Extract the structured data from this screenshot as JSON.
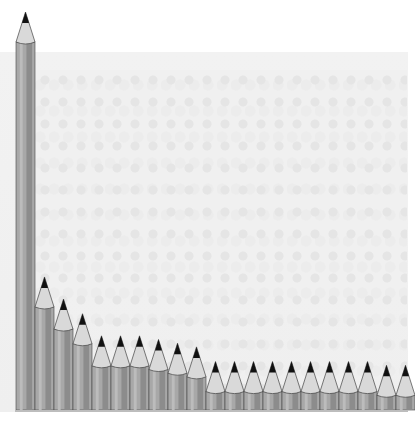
{
  "chart_data": {
    "type": "bar",
    "title": "",
    "xlabel": "",
    "ylabel": "",
    "style": "pencil-bars over grayscale crowd photo",
    "categories": [
      "1",
      "2",
      "3",
      "4",
      "5",
      "6",
      "7",
      "8",
      "9",
      "10",
      "11",
      "12",
      "13",
      "14",
      "15",
      "16",
      "17",
      "18",
      "19",
      "20",
      "21"
    ],
    "values": [
      100,
      28,
      22,
      18,
      12,
      12,
      12,
      11,
      10,
      9,
      5,
      5,
      5,
      5,
      5,
      5,
      5,
      5,
      5,
      4,
      4
    ],
    "grid": false,
    "legend": null
  },
  "colors": {
    "pencil_body": "#a8a8a8",
    "pencil_shade": "#8c8c8c",
    "pencil_wood": "#d9d9d9",
    "pencil_lead": "#111111",
    "background": "#f0f0f0"
  }
}
